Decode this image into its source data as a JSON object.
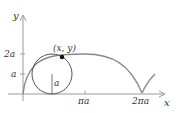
{
  "diagram": {
    "axes": {
      "x_label": "x",
      "y_label": "y",
      "x_ticks": [
        "πa",
        "2πa"
      ],
      "y_ticks": [
        "a",
        "2a"
      ]
    },
    "point_label": "(x, y)",
    "radius_label": "a",
    "colors": {
      "curve": "#8a8a8a",
      "axis": "#9a9a9a",
      "circle": "#555555",
      "point": "#111111",
      "text": "#333333"
    }
  }
}
